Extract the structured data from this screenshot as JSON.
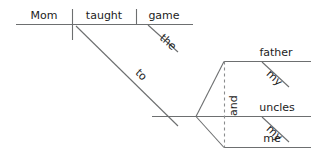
{
  "diagram": {
    "type": "reed-kellogg-sentence-diagram",
    "sentence": "Mom taught the game to my father, my uncles and me.",
    "line_color": "#6d6f70",
    "dashed_line_color": "#8a8c8d",
    "text_color": "#1c1c1c",
    "background_color": "#ffffff"
  },
  "labels": {
    "subject": "Mom",
    "verb": "taught",
    "direct_object": "game",
    "article": "the",
    "preposition": "to",
    "object_one": "father",
    "object_one_modifier": "my",
    "object_two": "uncles",
    "object_two_modifier": "my",
    "object_three": "me",
    "conjunction": "and"
  }
}
